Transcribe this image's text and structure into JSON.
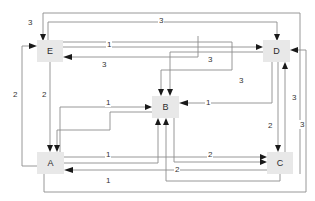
{
  "diagram": {
    "type": "directed-weighted-graph",
    "title": "",
    "background_color": "#ffffff",
    "node_fill": "#e8e8e8",
    "edge_color": "#8d8d8d",
    "arrow_color": "#1a1a1a",
    "nodes": [
      {
        "id": "E",
        "label": "E",
        "x": 37,
        "y": 40,
        "w": 26,
        "h": 22
      },
      {
        "id": "D",
        "label": "D",
        "x": 263,
        "y": 40,
        "w": 27,
        "h": 22
      },
      {
        "id": "B",
        "label": "B",
        "x": 152,
        "y": 96,
        "w": 27,
        "h": 22
      },
      {
        "id": "A",
        "label": "A",
        "x": 37,
        "y": 152,
        "w": 27,
        "h": 22
      },
      {
        "id": "C",
        "label": "C",
        "x": 267,
        "y": 152,
        "w": 26,
        "h": 22
      }
    ],
    "edges": [
      {
        "from": "C",
        "to": "E",
        "weight": "3",
        "label_x": 27,
        "label_y": 18
      },
      {
        "from": "E",
        "to": "D",
        "weight": "3",
        "label_x": 158,
        "label_y": 16
      },
      {
        "from": "E",
        "to": "D",
        "weight": "1",
        "label_x": 106,
        "label_y": 43
      },
      {
        "from": "D",
        "to": "E",
        "weight": "3",
        "label_x": 101,
        "label_y": 62
      },
      {
        "from": "A",
        "to": "E",
        "weight": "2",
        "label_x": 12,
        "label_y": 92
      },
      {
        "from": "E",
        "to": "A",
        "weight": "2",
        "label_x": 41,
        "label_y": 92
      },
      {
        "from": "E",
        "to": "B",
        "weight": "3",
        "label_x": 207,
        "label_y": 58
      },
      {
        "from": "D",
        "to": "B",
        "weight": "3",
        "label_x": 238,
        "label_y": 78
      },
      {
        "from": "A",
        "to": "B",
        "weight": "1",
        "label_x": 105,
        "label_y": 100
      },
      {
        "from": "D",
        "to": "B",
        "weight": "1",
        "label_x": 205,
        "label_y": 100
      },
      {
        "from": "D",
        "to": "C",
        "weight": "2",
        "label_x": 267,
        "label_y": 123
      },
      {
        "from": "C",
        "to": "D",
        "weight": "3",
        "label_x": 292,
        "label_y": 95
      },
      {
        "from": "A",
        "to": "D",
        "weight": "3",
        "label_x": 304,
        "label_y": 122
      },
      {
        "from": "A",
        "to": "C",
        "weight": "1",
        "label_x": 105,
        "label_y": 152
      },
      {
        "from": "B",
        "to": "C",
        "weight": "2",
        "label_x": 207,
        "label_y": 152
      },
      {
        "from": "C",
        "to": "A",
        "weight": "1",
        "label_x": 105,
        "label_y": 178
      },
      {
        "from": "C",
        "to": "B",
        "weight": "2",
        "label_x": 174,
        "label_y": 168
      }
    ]
  }
}
